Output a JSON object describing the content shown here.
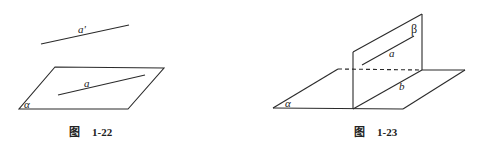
{
  "figures": [
    {
      "id": "fig-1-22",
      "caption_prefix": "图",
      "caption_number": "1-22",
      "labels": {
        "line_outside": "a'",
        "line_in_plane": "a",
        "plane": "α"
      }
    },
    {
      "id": "fig-1-23",
      "caption_prefix": "图",
      "caption_number": "1-23",
      "labels": {
        "horizontal_plane": "α",
        "vertical_plane": "β",
        "line_in_beta": "a",
        "intersection_line": "b"
      }
    }
  ]
}
